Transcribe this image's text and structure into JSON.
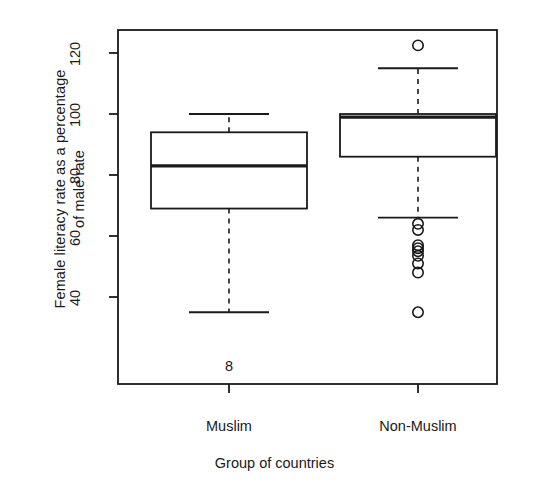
{
  "chart_data": {
    "type": "box",
    "title": "",
    "xlabel": "Group of countries",
    "ylabel": "Female literacy rate as a percentage\nof male rate",
    "ylabel_line1": "Female literacy rate as a percentage",
    "ylabel_line2": "of male rate",
    "categories": [
      "Muslim",
      "Non-Muslim"
    ],
    "ylim": [
      28,
      126
    ],
    "yticks": [
      40,
      60,
      80,
      100,
      120
    ],
    "ytick_labels": [
      "40",
      "60",
      "80",
      "100",
      "120"
    ],
    "grid": false,
    "legend": "none",
    "boxes": [
      {
        "name": "Muslim",
        "whisker_low": 35,
        "q1": 69,
        "median": 83,
        "q3": 94,
        "whisker_high": 100,
        "outliers": [],
        "annotation": "8"
      },
      {
        "name": "Non-Muslim",
        "whisker_low": 66,
        "q1": 86,
        "median": 99,
        "q3": 100,
        "whisker_high": 115,
        "outliers": [
          122.5,
          64,
          62,
          57,
          56,
          55,
          53.5,
          51,
          48,
          35
        ],
        "annotation": ""
      }
    ]
  },
  "style": {
    "axis_color": "#1a1a1a",
    "box_fill": "#ffffff",
    "line_color": "#1a1a1a",
    "background": "#ffffff"
  },
  "annotations": {
    "muslim_low_count": "8"
  }
}
